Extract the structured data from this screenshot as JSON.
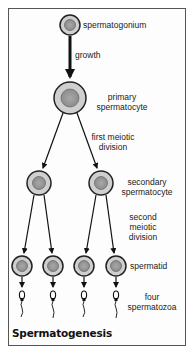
{
  "title": "Spermatogenesis",
  "labels": {
    "spermatogonium": "spermatogonium",
    "growth": "growth",
    "primary_1": "primary",
    "primary_2": "spermatocyte",
    "first_1": "first meiotic",
    "first_2": "division",
    "secondary_1": "secondary",
    "secondary_2": "spermatocyte",
    "second_1": "second",
    "second_2": "meiotic",
    "second_3": "division",
    "spermatid": "spermatid",
    "four_1": "four",
    "four_2": "spermatozoa"
  },
  "colors": {
    "cell_outer": "#c8c8c8",
    "cell_nucleus": "#9a9a9a",
    "stroke": "#222222",
    "frame": "#555555"
  }
}
